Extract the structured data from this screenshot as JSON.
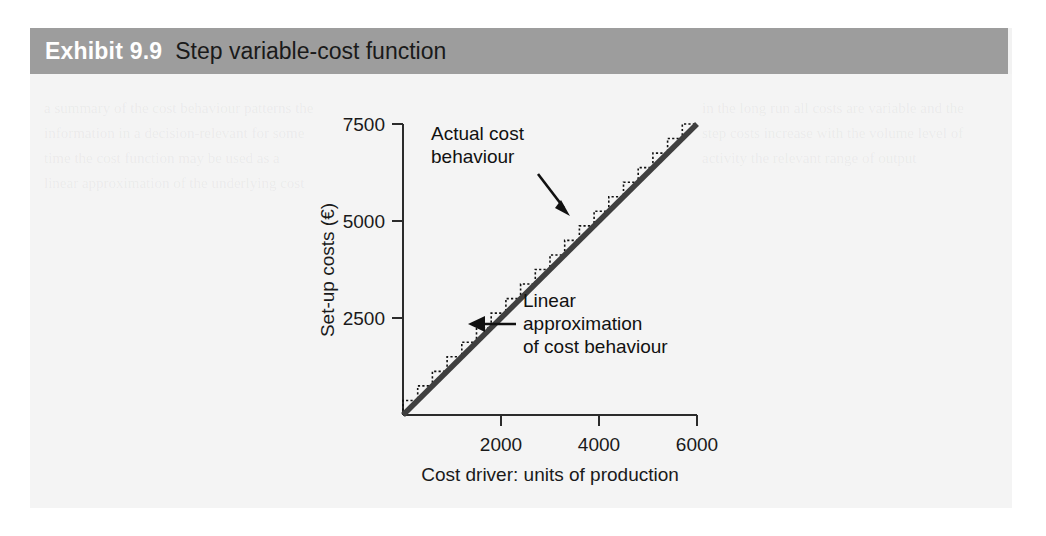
{
  "exhibit": {
    "number": "Exhibit 9.9",
    "title": "Step variable-cost function",
    "header_bg": "#9d9d9d",
    "number_color": "#ffffff",
    "title_color": "#1a1a1a"
  },
  "ghost_text": {
    "left": "a summary of the cost behaviour patterns the information in a decision-relevant for some time the cost function may be used as a linear approximation of the underlying cost",
    "right": "in the long run all costs are variable and the step costs increase with the volume level of activity the relevant range of output"
  },
  "chart_data": {
    "type": "line",
    "title": "Step variable-cost function",
    "xlabel": "Cost driver: units of production",
    "ylabel": "Set-up costs (€)",
    "xlim": [
      0,
      6000
    ],
    "ylim": [
      0,
      7500
    ],
    "xticks": [
      2000,
      4000,
      6000
    ],
    "yticks": [
      2500,
      5000,
      7500
    ],
    "xtick_labels": [
      "2000",
      "4000",
      "6000"
    ],
    "ytick_labels": [
      "2500",
      "5000",
      "7500"
    ],
    "grid": false,
    "legend": false,
    "series": [
      {
        "name": "Linear approximation of cost behaviour",
        "style": "solid-thick",
        "color": "#3a3a3a",
        "x": [
          0,
          6000
        ],
        "values": [
          0,
          7500
        ]
      },
      {
        "name": "Actual cost behaviour",
        "style": "dotted-step",
        "color": "#111111",
        "step_count": 20,
        "step_width": 300,
        "step_height": 375,
        "x": [
          0,
          300,
          600,
          900,
          1200,
          1500,
          1800,
          2100,
          2400,
          2700,
          3000,
          3300,
          3600,
          3900,
          4200,
          4500,
          4800,
          5100,
          5400,
          5700,
          6000
        ],
        "values": [
          375,
          750,
          1125,
          1500,
          1875,
          2250,
          2625,
          3000,
          3375,
          3750,
          4125,
          4500,
          4875,
          5250,
          5625,
          6000,
          6375,
          6750,
          7125,
          7500,
          7500
        ]
      }
    ],
    "annotations": [
      {
        "id": "actual-cost-behaviour",
        "line1": "Actual cost",
        "line2": "behaviour",
        "arrow": "diagonal-down-right",
        "target_x": 3300,
        "target_y": 4125
      },
      {
        "id": "linear-approximation",
        "line1": "Linear",
        "line2": "approximation",
        "line3": "of cost behaviour",
        "arrow": "horizontal-left",
        "target_x": 1750,
        "target_y": 2200
      }
    ]
  }
}
